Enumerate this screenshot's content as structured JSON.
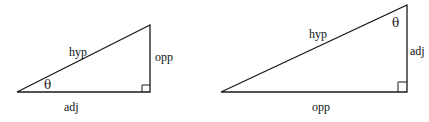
{
  "triangles": [
    {
      "name": "left",
      "labels": {
        "hypotenuse": "hyp",
        "vertical": "opp",
        "horizontal": "adj",
        "angle": "θ"
      }
    },
    {
      "name": "right",
      "labels": {
        "hypotenuse": "hyp",
        "vertical": "adj",
        "horizontal": "opp",
        "angle": "θ"
      }
    }
  ],
  "colors": {
    "stroke": "#1a1a1a",
    "background": "#ffffff"
  }
}
